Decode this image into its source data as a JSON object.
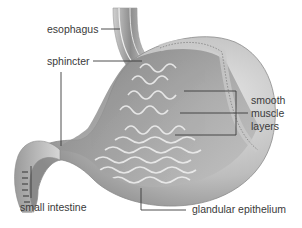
{
  "figure": {
    "labels": {
      "esophagus": "esophagus",
      "sphincter": "sphincter",
      "smooth_muscle_line1": "smooth",
      "smooth_muscle_line2": "muscle",
      "smooth_muscle_line3": "layers",
      "small_intestine": "small intestine",
      "glandular_epithelium": "glandular epithelium"
    },
    "colors": {
      "text": "#3a3a3a",
      "tissue_light": "#d8d8d8",
      "tissue_mid": "#a8a8a8",
      "tissue_dark": "#6e6e6e",
      "background": "#ffffff"
    }
  }
}
